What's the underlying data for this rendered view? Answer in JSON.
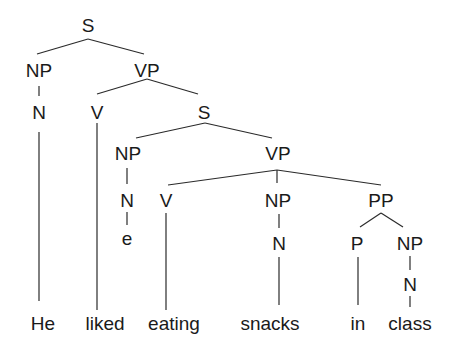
{
  "diagram": {
    "type": "syntax-tree",
    "nodes": {
      "s_root": "S",
      "np_subject": "NP",
      "vp_main": "VP",
      "n_subject": "N",
      "v_liked": "V",
      "s_embedded": "S",
      "np_embedded": "NP",
      "vp_embedded": "VP",
      "n_empty": "N",
      "empty": "e",
      "v_eating": "V",
      "np_object": "NP",
      "pp": "PP",
      "n_object": "N",
      "p": "P",
      "np_pp": "NP",
      "n_pp": "N"
    },
    "words": [
      "He",
      "liked",
      "eating",
      "snacks",
      "in",
      "class"
    ],
    "sentence": "He liked eating snacks in class"
  }
}
